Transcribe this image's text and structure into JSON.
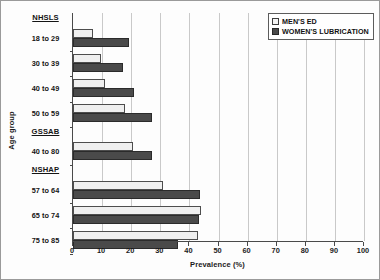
{
  "chart_data": {
    "type": "bar",
    "orientation": "horizontal",
    "title": "",
    "xlabel": "Prevalence (%)",
    "ylabel": "Age group",
    "xlim": [
      0,
      100
    ],
    "xticks": [
      0,
      10,
      20,
      30,
      40,
      50,
      60,
      70,
      80,
      90,
      100
    ],
    "grid": true,
    "legend_position": "top-right",
    "legend": [
      {
        "name": "MEN'S ED",
        "swatch": "light"
      },
      {
        "name": "WOMEN'S LUBRICATION",
        "swatch": "dark"
      }
    ],
    "series": [
      {
        "name": "MEN'S ED",
        "values": [
          6.9,
          9.5,
          10.9,
          17.8,
          20.7,
          30.8,
          43.9,
          43.1
        ]
      },
      {
        "name": "WOMEN'S LUBRICATION",
        "values": [
          19.3,
          17.2,
          21.0,
          27.0,
          27.0,
          43.7,
          43.4,
          36.2
        ]
      }
    ],
    "categories": [
      "18 to 29",
      "30 to 39",
      "40 to 49",
      "50 to 59",
      "40 to 80",
      "57 to 64",
      "65 to 74",
      "75 to 85"
    ],
    "groups": [
      {
        "header": "NHSLS",
        "categories": [
          "18 to 29",
          "30 to 39",
          "40 to 49",
          "50 to 59"
        ]
      },
      {
        "header": "GSSAB",
        "categories": [
          "40 to 80"
        ]
      },
      {
        "header": "NSHAP",
        "categories": [
          "57 to 64",
          "65 to 74",
          "75 to 85"
        ]
      }
    ],
    "colors": {
      "light_bar": "#efefef",
      "dark_bar": "#4a4a4a",
      "axis": "#4a4a4a",
      "grid": "#c9c9c9"
    }
  }
}
